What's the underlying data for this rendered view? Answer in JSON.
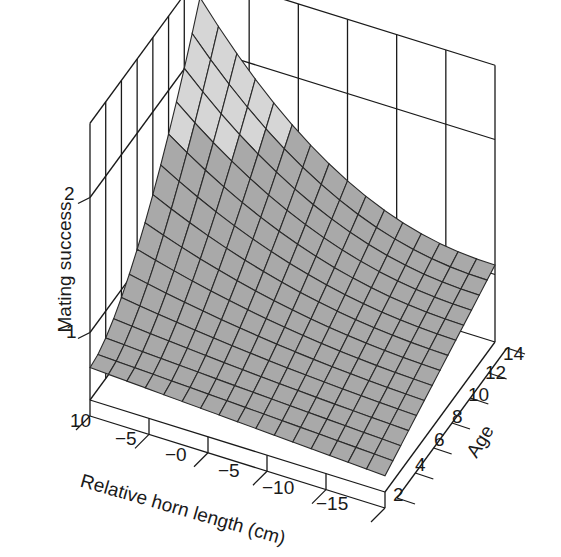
{
  "chart_data": {
    "type": "surface3d",
    "title": "",
    "xlabel": "Relative horn length (cm)",
    "ylabel": "Age",
    "zlabel": "Mating success",
    "x_ticks": [
      "10",
      "−5",
      "−0",
      "−5",
      "−10",
      "−15"
    ],
    "y_ticks": [
      "2",
      "4",
      "6",
      "8",
      "10",
      "12",
      "14"
    ],
    "z_ticks": [
      "1",
      "2"
    ],
    "x_range": [
      10,
      -15
    ],
    "y_range": [
      2,
      14
    ],
    "z_range": [
      0.5,
      2.6
    ],
    "grid": true,
    "colors": {
      "surface_high": "#d6d6d6",
      "surface_low": "#a9a9a9",
      "mesh": "#2a2a2a",
      "frame": "#1a1a1a"
    },
    "surface_description": "Mating success surface over relative horn length and age; peaks (~2.3) at large horn length and old age, lowest (~0.6) at small horn length and young age; shading changes at ~1.6",
    "approx_values": [
      {
        "horn": 10,
        "age": 2,
        "success": 0.72
      },
      {
        "horn": 10,
        "age": 14,
        "success": 2.35
      },
      {
        "horn": -15,
        "age": 2,
        "success": 0.6
      },
      {
        "horn": -15,
        "age": 14,
        "success": 1.15
      },
      {
        "horn": 0,
        "age": 8,
        "success": 0.9
      }
    ]
  },
  "labels": {
    "z_title": "Mating success",
    "x_title": "Relative horn length (cm)",
    "y_title": "Age",
    "z_tick_1": "1",
    "z_tick_2": "2",
    "x_tick_0": "10",
    "x_tick_1": "−5",
    "x_tick_2": "−0",
    "x_tick_3": "−5",
    "x_tick_4": "−10",
    "x_tick_5": "−15",
    "y_tick_0": "2",
    "y_tick_1": "4",
    "y_tick_2": "6",
    "y_tick_3": "8",
    "y_tick_4": "10",
    "y_tick_5": "12",
    "y_tick_6": "14"
  }
}
